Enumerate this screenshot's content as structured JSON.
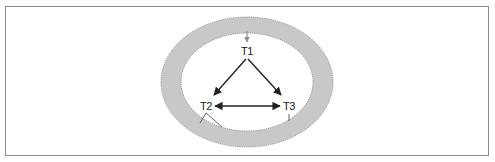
{
  "diagram": {
    "type": "cycle-in-ring",
    "colors": {
      "frame": "#8a8a8a",
      "ring_fill": "#c8c8c8",
      "ring_stroke": "#8f8f8f",
      "arrow": "#222222",
      "entry_arrow": "#8f8f8f"
    },
    "nodes": [
      {
        "id": "T1",
        "label": "T1"
      },
      {
        "id": "T2",
        "label": "T2"
      },
      {
        "id": "T3",
        "label": "T3"
      }
    ],
    "edges": [
      {
        "from": "T1",
        "to": "T2",
        "direction": "forward"
      },
      {
        "from": "T1",
        "to": "T3",
        "direction": "forward"
      },
      {
        "from": "T2",
        "to": "T3",
        "direction": "bidirectional"
      }
    ]
  }
}
